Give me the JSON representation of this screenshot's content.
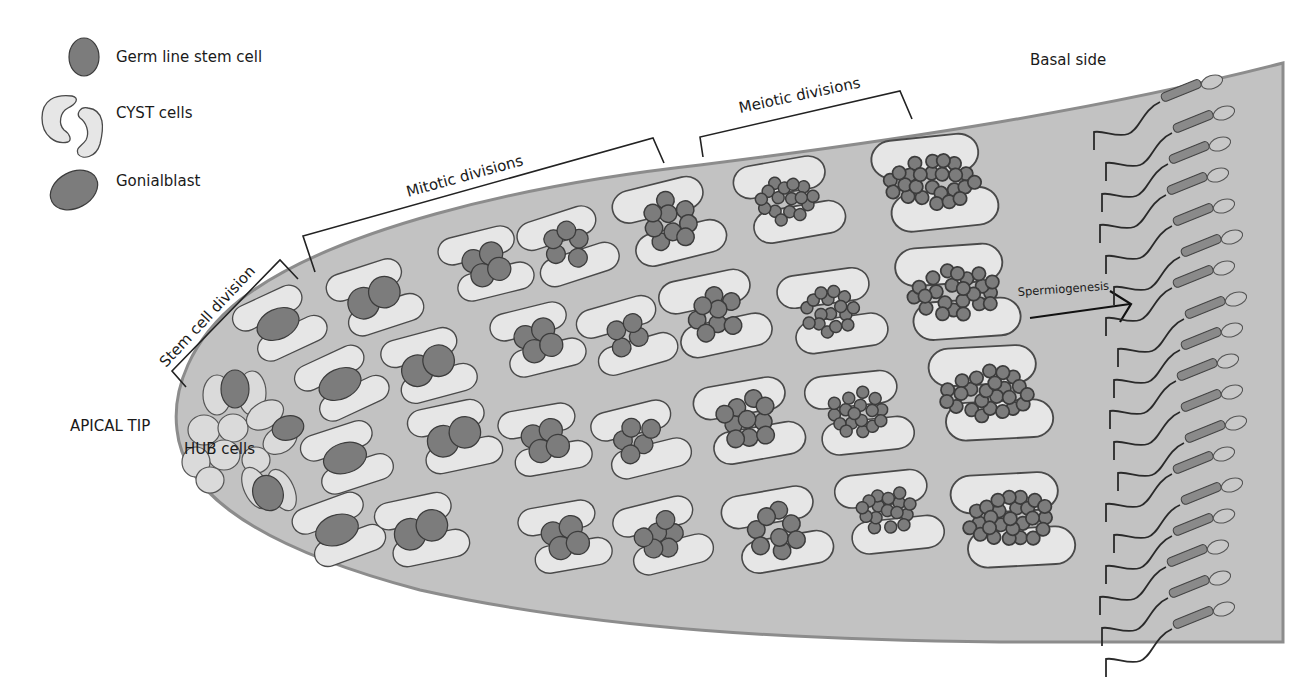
{
  "diagram": {
    "colors": {
      "background": "#ffffff",
      "tube_fill": "#c2c2c2",
      "tube_outline": "#8c8c8c",
      "cyst_cell_fill": "#e6e6e6",
      "germ_cell_fill": "#7c7c7c",
      "text": "#1a1a1a"
    },
    "legend": {
      "items": [
        {
          "label": "Germ line stem cell",
          "icon": "germ-line-stem-cell-icon"
        },
        {
          "label": "CYST cells",
          "icon": "cyst-cells-icon"
        },
        {
          "label": "Gonialblast",
          "icon": "gonialblast-icon"
        }
      ]
    },
    "labels": {
      "apical_tip": "APICAL TIP",
      "hub_cells": "HUB cells",
      "basal_side": "Basal side",
      "spermiogenesis": "Spermiogenesis"
    },
    "stages": [
      {
        "label": "Stem cell division"
      },
      {
        "label": "Mitotic divisions"
      },
      {
        "label": "Meiotic divisions"
      }
    ],
    "cyst_columns": [
      {
        "stage": "gonialblast",
        "germ_cells": 1
      },
      {
        "stage": "2-cell",
        "germ_cells": 2
      },
      {
        "stage": "4-cell",
        "germ_cells": 4
      },
      {
        "stage": "8-cell",
        "germ_cells": 8
      },
      {
        "stage": "16-cell",
        "germ_cells": 16
      },
      {
        "stage": "meiotic",
        "germ_cells": 32
      },
      {
        "stage": "spermatid",
        "germ_cells": 64
      }
    ],
    "sperm_count": 18
  }
}
